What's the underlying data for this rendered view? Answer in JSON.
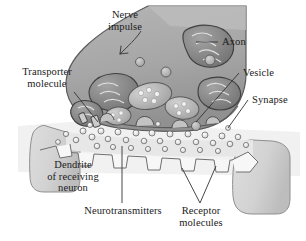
{
  "figure": {
    "background_color": "#ffffff"
  },
  "palette": {
    "axon_fill": "#a9a9a9",
    "axon_fill_dark": "#8f8f8f",
    "axon_edge": "#555555",
    "dendrite_fill": "#d6d6d6",
    "dendrite_edge": "#8a8a8a",
    "cleft_fill": "#f1f1f1",
    "mitochondria_fill": "#8a8a8a",
    "mitochondria_edge": "#4a4a4a",
    "vesicle_fill": "#b9b9b9",
    "vesicle_edge": "#5a5a5a",
    "neurotransmitter_fill": "#e8e8e8",
    "neurotransmitter_edge": "#6b6b6b",
    "receptor_fill": "#f6f6f6",
    "receptor_edge": "#6f6f6f",
    "text_color": "#1a1a1a",
    "leader_color": "#333333"
  },
  "labels": {
    "nerve_impulse": "Nerve\nimpulse",
    "transporter_molecule": "Transporter\nmolecule",
    "axon": "Axon",
    "vesicle": "Vesicle",
    "synapse": "Synapse",
    "dendrite": "Dendrite\nof receiving\nneuron",
    "neurotransmitters": "Neurotransmitters",
    "receptor_molecules": "Receptor\nmolecules"
  },
  "structures": {
    "axon_terminal": "axon-terminal",
    "mitochondria_count": 4,
    "vesicles_free_count": 7,
    "vesicles_fusing_count": 4,
    "receptor_count": 6,
    "neurotransmitter_dot_count": 34,
    "transporter_count": 2
  }
}
